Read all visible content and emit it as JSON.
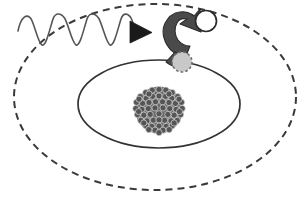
{
  "figure": {
    "title": "Atomic electron excitation by an incident photon",
    "width": 308,
    "height": 206,
    "background_color": "#ffffff"
  },
  "colors": {
    "wave_stroke": "#555555",
    "arrowhead_fill": "#1a1a1a",
    "curved_arrow_fill": "#4a4a4a",
    "curved_arrow_stroke": "#2b2b2b",
    "orbit_inner_stroke": "#333333",
    "orbit_outer_stroke": "#3a3a3a",
    "electron_ground_fill": "#c8c8c8",
    "electron_ground_stroke": "#707070",
    "electron_excited_fill": "#ffffff",
    "electron_excited_stroke": "#2b2b2b",
    "nucleon_fill": "#555555",
    "nucleon_stroke": "#d8d8d8"
  },
  "elements": {
    "photon_wave": {
      "label": "incident photon wave",
      "start_x": 18,
      "end_x": 133,
      "center_y": 30,
      "amplitude": 15,
      "cycles": 3.25,
      "stroke_width": 1.6
    },
    "photon_arrowhead": {
      "label": "photon direction arrowhead",
      "tip_x": 151,
      "tip_y": 32,
      "back_x": 131,
      "half_height": 11
    },
    "excitation_arrow": {
      "label": "electron excitation transition arrow",
      "from": "ground-state electron",
      "to": "excited-state electron"
    },
    "inner_orbit": {
      "label": "ground state orbit",
      "style": "solid",
      "cx": 159,
      "cy": 104,
      "rx": 81,
      "ry": 44,
      "stroke_width": 1.7
    },
    "outer_orbit": {
      "label": "excited state orbit",
      "style": "dashed",
      "cx": 155,
      "cy": 97,
      "rx": 141,
      "ry": 93,
      "stroke_width": 2.0,
      "dash_pattern": "7 5"
    },
    "nucleus": {
      "label": "atomic nucleus",
      "cx": 159,
      "cy": 110,
      "radius": 24,
      "nucleon_radius": 3.1,
      "nucleon_count": 61
    },
    "electron_ground": {
      "label": "electron in ground state",
      "cx": 182,
      "cy": 62,
      "radius": 10.5,
      "border_style": "dashed"
    },
    "electron_excited": {
      "label": "electron in excited state",
      "cx": 206,
      "cy": 21,
      "radius": 10.5,
      "border_style": "solid"
    }
  }
}
